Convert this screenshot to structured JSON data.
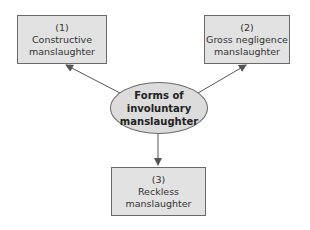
{
  "center": {
    "lines": [
      "Forms of",
      "involuntary",
      "manslaughter"
    ]
  },
  "nodes": [
    {
      "number": "(1)",
      "line1": "Constructive",
      "line2": "manslaughter"
    },
    {
      "number": "(2)",
      "line1": "Gross negligence",
      "line2": "manslaughter"
    },
    {
      "number": "(3)",
      "line1": "Reckless",
      "line2": "manslaughter"
    }
  ],
  "colors": {
    "box_fill": "#e2e2e2",
    "ellipse_fill": "#dcdcdc",
    "stroke": "#6a6a6a"
  }
}
